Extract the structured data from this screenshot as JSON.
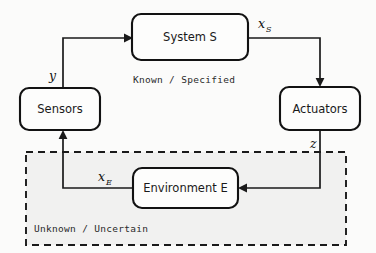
{
  "diagram": {
    "background_color": "#fbfbfa",
    "line_color": "#1a1a1a",
    "box_fill": "#fdfdfc",
    "region_fill": "#f1f1f0",
    "nodes": [
      {
        "id": "system",
        "label": "System S",
        "x": 132,
        "y": 14,
        "w": 116,
        "h": 46
      },
      {
        "id": "sensors",
        "label": "Sensors",
        "x": 20,
        "y": 88,
        "w": 80,
        "h": 42
      },
      {
        "id": "actuators",
        "label": "Actuators",
        "x": 280,
        "y": 87,
        "w": 80,
        "h": 43
      },
      {
        "id": "environment",
        "label": "Environment E",
        "x": 133,
        "y": 168,
        "w": 105,
        "h": 40
      }
    ],
    "region": {
      "id": "unknown-region",
      "label": "Unknown / Uncertain",
      "x": 26,
      "y": 152,
      "w": 320,
      "h": 93,
      "label_x": 34,
      "label_y": 232
    },
    "annotations": [
      {
        "id": "known-specified",
        "label": "Known / Specified",
        "x": 133,
        "y": 82
      }
    ],
    "signals": [
      {
        "id": "x-s",
        "base": "x",
        "sub": "S",
        "x": 258,
        "y": 28,
        "from": "system",
        "to": "actuators"
      },
      {
        "id": "z",
        "base": "z",
        "sub": "",
        "x": 313,
        "y": 148,
        "from": "actuators",
        "to": "environment"
      },
      {
        "id": "x-e",
        "base": "x",
        "sub": "E",
        "x": 100,
        "y": 181,
        "from": "environment",
        "to": "sensors"
      },
      {
        "id": "y",
        "base": "y",
        "sub": "",
        "x": 52,
        "y": 78,
        "from": "sensors",
        "to": "system"
      }
    ]
  }
}
